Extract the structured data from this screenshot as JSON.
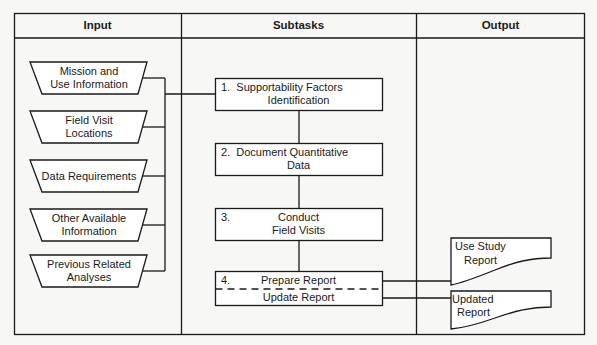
{
  "headers": {
    "input": "Input",
    "subtasks": "Subtasks",
    "output": "Output"
  },
  "inputs": [
    {
      "line1": "Mission and",
      "line2": "Use Information"
    },
    {
      "line1": "Field Visit",
      "line2": "Locations"
    },
    {
      "line1": "Data Requirements",
      "line2": ""
    },
    {
      "line1": "Other Available",
      "line2": "Information"
    },
    {
      "line1": "Previous Related",
      "line2": "Analyses"
    }
  ],
  "subtasks": [
    {
      "num": "1.",
      "line1": "Supportability Factors",
      "line2": "Identification"
    },
    {
      "num": "2.",
      "line1": "Document Quantitative",
      "line2": "Data"
    },
    {
      "num": "3.",
      "line1": "Conduct",
      "line2": "Field Visits"
    },
    {
      "num": "4.",
      "line1": "Prepare Report",
      "line2": "Update Report"
    }
  ],
  "outputs": [
    {
      "line1": "Use Study",
      "line2": "Report"
    },
    {
      "line1": "Updated",
      "line2": "Report"
    }
  ],
  "colors": {
    "line": "#1a1a1a",
    "background": "#f7f7f5",
    "box_fill": "#ffffff"
  }
}
